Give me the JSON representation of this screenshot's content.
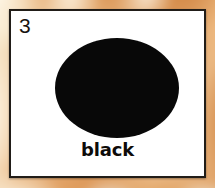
{
  "card": {
    "number": "3",
    "label": "black",
    "swatch": {
      "shape": "ellipse",
      "color": "#080808",
      "name": "black-color-swatch"
    },
    "card_background": "#ffffff",
    "border_color": "#211d18"
  },
  "background": {
    "description": "blurred mottled orange and cream texture",
    "base_color": "#e7a869",
    "light_color": "#f8ecd6",
    "dark_color": "#cd8240"
  }
}
